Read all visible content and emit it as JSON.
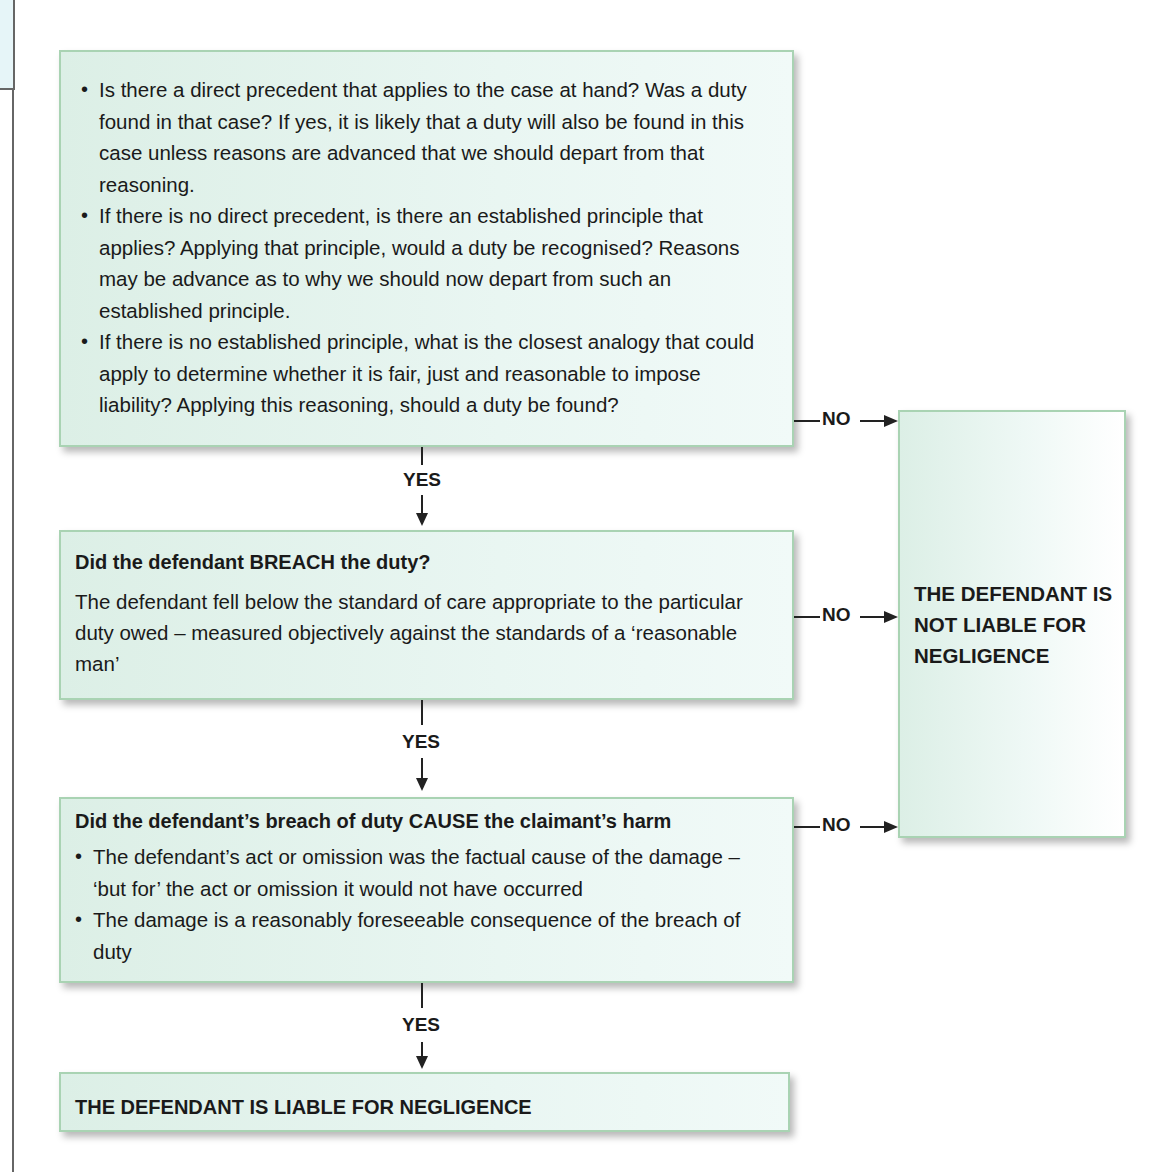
{
  "flowchart": {
    "duty_box": {
      "bullets": [
        "Is there a direct precedent that applies to the case at hand? Was a duty found in that case? If yes, it is likely that a duty will also be found in this case unless reasons are advanced that we should depart from that reasoning.",
        "If there is no direct precedent, is there an established principle that applies? Applying that principle, would a duty be recognised? Reasons may be advance as to why we should now depart from such an established principle.",
        "If there is no established principle, what is the closest analogy that could apply to determine whether it is fair, just and reasonable to impose liability? Applying this reasoning, should a duty be found?"
      ]
    },
    "breach_box": {
      "heading": "Did the defendant BREACH the duty?",
      "text": "The defendant fell below the standard of care appropriate to the particular duty owed – measured objectively against the standards of a ‘reasonable man’"
    },
    "cause_box": {
      "heading": "Did the defendant’s breach of duty CAUSE the claimant’s harm",
      "bullets": [
        "The defendant’s act or omission was the factual cause of the damage – ‘but for’ the act or omission it would not have occurred",
        "The damage is a reasonably foreseeable consequence of the breach of duty"
      ]
    },
    "liable_box": {
      "text": "THE DEFENDANT IS LIABLE FOR NEGLIGENCE"
    },
    "not_liable_box": {
      "text": "THE DEFENDANT IS NOT LIABLE FOR NEGLIGENCE"
    },
    "connectors": {
      "yes_label": "YES",
      "no_label": "NO"
    }
  }
}
